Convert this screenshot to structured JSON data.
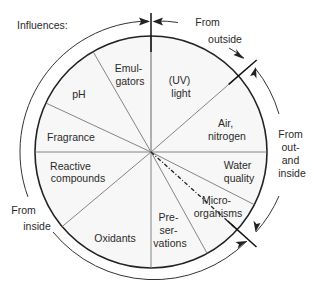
{
  "title": "Influences:",
  "segments": [
    {
      "id": "emulgators",
      "lines": [
        "Emul-",
        "gators"
      ]
    },
    {
      "id": "uv-light",
      "lines": [
        "(UV)",
        "light"
      ]
    },
    {
      "id": "air-nitrogen",
      "lines": [
        "Air,",
        "nitrogen"
      ]
    },
    {
      "id": "water-quality",
      "lines": [
        "Water",
        "quality"
      ]
    },
    {
      "id": "microorganisms",
      "lines": [
        "Micro-",
        "organisms"
      ]
    },
    {
      "id": "preservations",
      "lines": [
        "Pre-",
        "ser-",
        "vations"
      ]
    },
    {
      "id": "oxidants",
      "lines": [
        "Oxidants"
      ]
    },
    {
      "id": "reactive-compounds",
      "lines": [
        "Reactive",
        "compounds"
      ]
    },
    {
      "id": "fragrance",
      "lines": [
        "Fragrance"
      ]
    },
    {
      "id": "ph",
      "lines": [
        "pH"
      ]
    }
  ],
  "groups": {
    "from_outside": {
      "lines": [
        "From",
        "outside"
      ]
    },
    "from_out_and_inside": {
      "lines": [
        "From",
        "out-",
        "and",
        "inside"
      ]
    },
    "from_inside": {
      "lines": [
        "From",
        "inside"
      ]
    }
  },
  "colors": {
    "stroke": "#222222",
    "spoke": "#777777",
    "fill": "#f7f7f7",
    "text": "#2a2a2a"
  }
}
